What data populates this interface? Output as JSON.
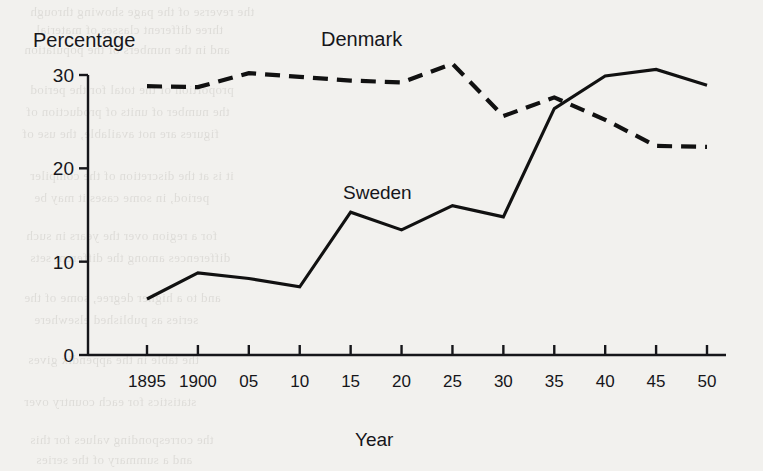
{
  "chart_data": {
    "type": "line",
    "title": "",
    "xlabel": "Year",
    "ylabel": "Percentage",
    "x": [
      1895,
      1900,
      1905,
      1910,
      1915,
      1920,
      1925,
      1930,
      1935,
      1940,
      1945,
      1950
    ],
    "xtick_labels": [
      "1895",
      "1900",
      "05",
      "10",
      "15",
      "20",
      "25",
      "30",
      "35",
      "40",
      "45",
      "50"
    ],
    "ytick_labels": [
      "0",
      "10",
      "20",
      "30"
    ],
    "ytick_values": [
      0,
      10,
      20,
      30
    ],
    "ylim": [
      0,
      32
    ],
    "xlim": [
      1895,
      1950
    ],
    "grid": false,
    "legend_position": "inline-annotation",
    "series": [
      {
        "name": "Denmark",
        "style": "dashed",
        "color": "#111111",
        "values": [
          28.8,
          28.7,
          30.2,
          29.8,
          29.4,
          29.2,
          31.2,
          25.6,
          27.6,
          25.2,
          22.4,
          22.3
        ]
      },
      {
        "name": "Sweden",
        "style": "solid",
        "color": "#111111",
        "values": [
          6.0,
          8.8,
          8.2,
          7.3,
          15.3,
          13.4,
          16.0,
          14.8,
          26.4,
          29.9,
          30.6,
          28.9
        ]
      }
    ],
    "annotations": [
      {
        "text": "Denmark",
        "x": 1925,
        "y": 33.5
      },
      {
        "text": "Sweden",
        "x": 1916,
        "y": 19.5
      }
    ]
  },
  "axis": {
    "y_title": "Percentage",
    "x_title": "Year"
  },
  "bleed_through": [
    {
      "text": "the reverse of the page showing through",
      "left": 30,
      "top": 4
    },
    {
      "text": "three different classes of material",
      "left": 36,
      "top": 22
    },
    {
      "text": "and in the numbers of the population",
      "left": 24,
      "top": 42
    },
    {
      "text": "proportion of the total for the period",
      "left": 30,
      "top": 82
    },
    {
      "text": "the number of units of production of",
      "left": 26,
      "top": 104
    },
    {
      "text": "figures are not available, the use of",
      "left": 22,
      "top": 126
    },
    {
      "text": "it is at the discretion of the compiler",
      "left": 30,
      "top": 168
    },
    {
      "text": "period, in some cases it may be",
      "left": 34,
      "top": 190
    },
    {
      "text": "for a region over the years in such",
      "left": 26,
      "top": 228
    },
    {
      "text": "differences among the different sets",
      "left": 30,
      "top": 250
    },
    {
      "text": "and to a higher degree, some of the",
      "left": 24,
      "top": 290
    },
    {
      "text": "series as published elsewhere",
      "left": 34,
      "top": 312
    },
    {
      "text": "the table in the appendix gives",
      "left": 28,
      "top": 352
    },
    {
      "text": "statistics for each country over",
      "left": 24,
      "top": 394
    },
    {
      "text": "the corresponding values for this",
      "left": 30,
      "top": 432
    },
    {
      "text": "and a summary of the series",
      "left": 36,
      "top": 452
    }
  ]
}
